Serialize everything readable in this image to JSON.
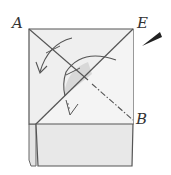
{
  "diagram": {
    "type": "origami-fold-instruction",
    "labels": {
      "a": "A",
      "e": "E",
      "b": "B"
    },
    "elements": [
      {
        "name": "paper-square",
        "description": "square sheet with corners A (top-left), E (top-right)"
      },
      {
        "name": "diagonal-crease-A-B",
        "style": "valley line then dash-dot",
        "from": "A",
        "to": "B"
      },
      {
        "name": "fold-line-E",
        "style": "solid diagonal from E to lower-left"
      },
      {
        "name": "fold-arrow-left",
        "description": "curved arrow folding top-left area down"
      },
      {
        "name": "fold-arrow-center",
        "description": "curved arrow across the diagonal, shaded flap"
      },
      {
        "name": "bottom-flap",
        "description": "folded rectangular flap along bottom"
      },
      {
        "name": "pencil-tip-mark",
        "description": "dark wedge pointer near corner E"
      }
    ],
    "colors": {
      "paper": "#eeeeee",
      "shade": "#d6d6d6",
      "line": "#555555",
      "pointer": "#222222"
    }
  }
}
